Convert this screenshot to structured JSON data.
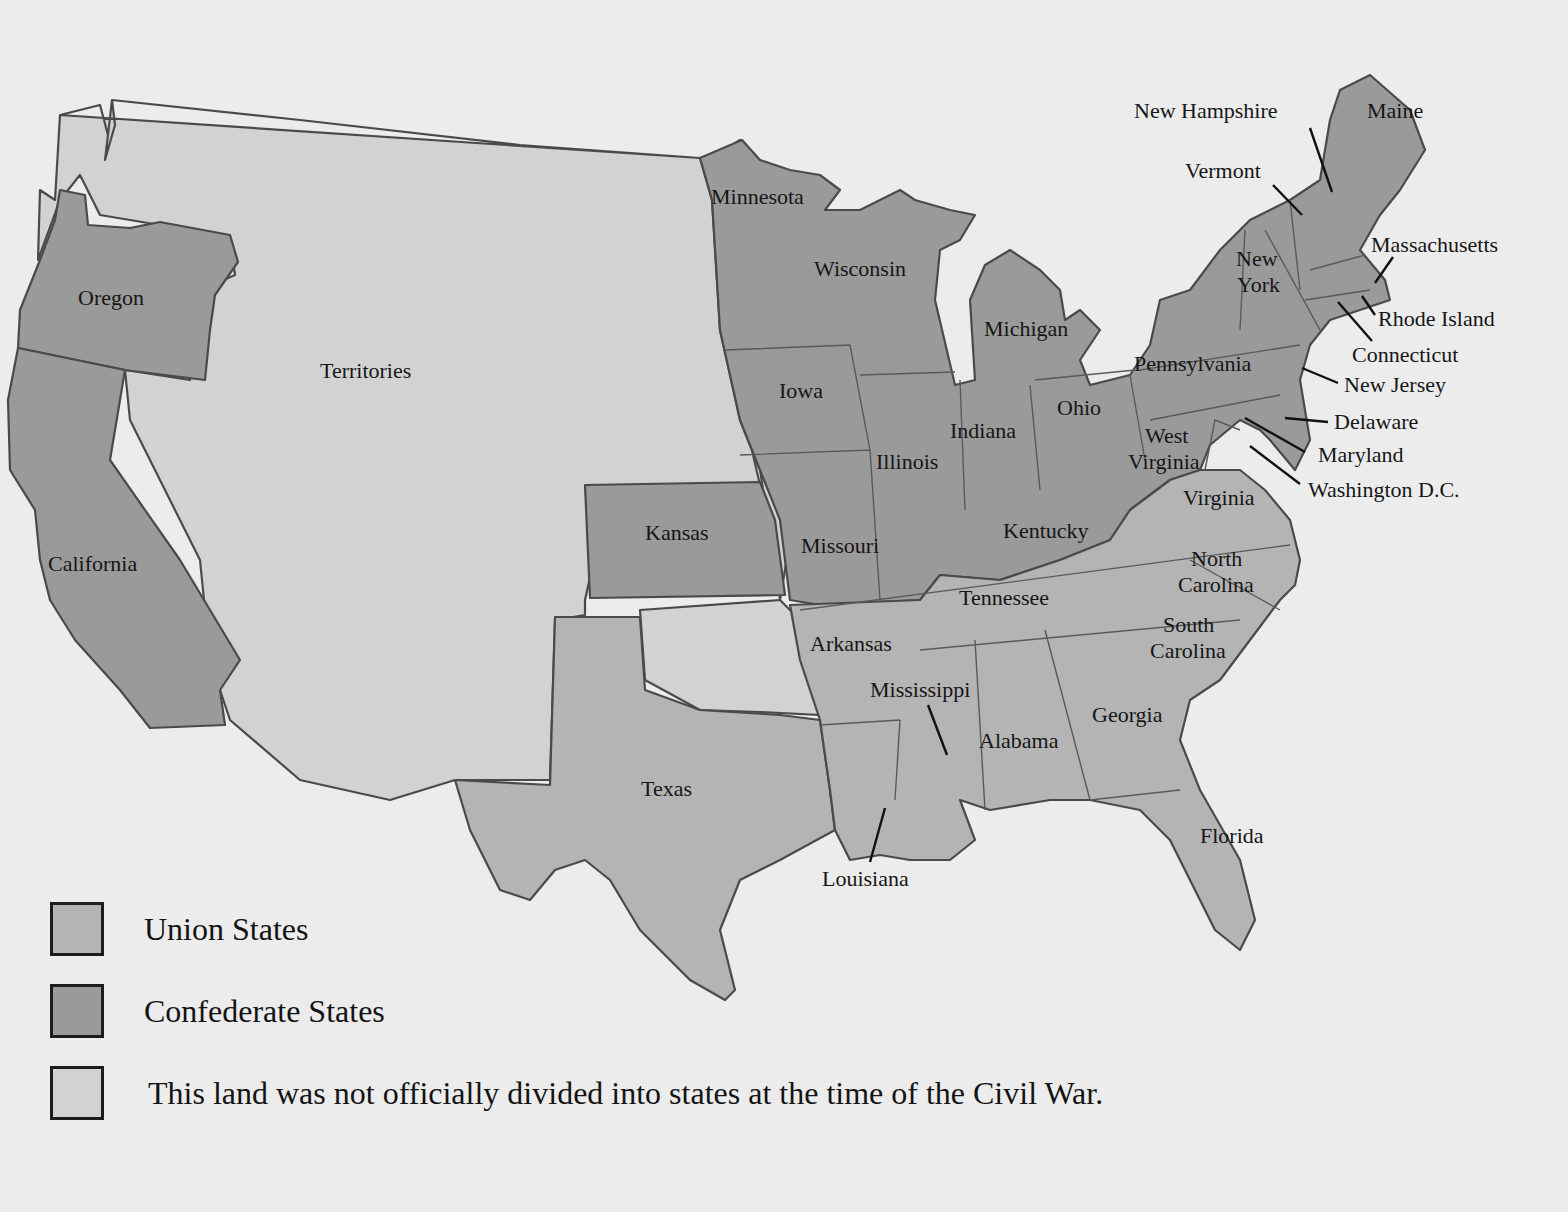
{
  "map": {
    "subject": "United States at the time of the Civil War",
    "colors": {
      "background": "#ececec",
      "dark_tone": "#9a9a9a",
      "medium_tone": "#b4b4b4",
      "light_tone": "#d2d2d2",
      "outline": "#4a4a4a"
    },
    "regions": {
      "territories": "Territories",
      "oregon": "Oregon",
      "california": "California",
      "kansas": "Kansas",
      "minnesota": "Minnesota",
      "wisconsin": "Wisconsin",
      "michigan": "Michigan",
      "iowa": "Iowa",
      "illinois": "Illinois",
      "indiana": "Indiana",
      "ohio": "Ohio",
      "missouri": "Missouri",
      "kentucky": "Kentucky",
      "west_virginia_1": "West",
      "west_virginia_2": "Virginia",
      "virginia": "Virginia",
      "pennsylvania": "Pennsylvania",
      "new_york_1": "New",
      "new_york_2": "York",
      "vermont": "Vermont",
      "new_hampshire": "New Hampshire",
      "maine": "Maine",
      "massachusetts": "Massachusetts",
      "rhode_island": "Rhode Island",
      "connecticut": "Connecticut",
      "new_jersey": "New Jersey",
      "delaware": "Delaware",
      "maryland": "Maryland",
      "washington_dc": "Washington D.C.",
      "north_carolina_1": "North",
      "north_carolina_2": "Carolina",
      "south_carolina_1": "South",
      "south_carolina_2": "Carolina",
      "tennessee": "Tennessee",
      "arkansas": "Arkansas",
      "mississippi": "Mississippi",
      "alabama": "Alabama",
      "georgia": "Georgia",
      "florida": "Florida",
      "louisiana": "Louisiana",
      "texas": "Texas"
    },
    "shading_by_tone": {
      "dark": [
        "Oregon",
        "California",
        "Kansas",
        "Minnesota",
        "Wisconsin",
        "Michigan",
        "Iowa",
        "Illinois",
        "Indiana",
        "Ohio",
        "Missouri",
        "Kentucky",
        "West Virginia",
        "Pennsylvania",
        "New York",
        "Vermont",
        "New Hampshire",
        "Maine",
        "Massachusetts",
        "Rhode Island",
        "Connecticut",
        "New Jersey",
        "Delaware",
        "Maryland"
      ],
      "medium": [
        "Virginia",
        "North Carolina",
        "South Carolina",
        "Tennessee",
        "Arkansas",
        "Mississippi",
        "Alabama",
        "Georgia",
        "Florida",
        "Louisiana",
        "Texas"
      ],
      "light": [
        "Territories"
      ]
    }
  },
  "legend": {
    "items": [
      {
        "label": "Union States",
        "swatch": "#b4b4b4"
      },
      {
        "label": "Confederate States",
        "swatch": "#9a9a9a"
      },
      {
        "label": "This land was not officially divided into states at the time of the Civil War.",
        "swatch": "#d2d2d2"
      }
    ],
    "legend_shading_note": "As printed in the source, the legend swatches appear swapped relative to the map: the map shades Union states (e.g. Kansas, Illinois, Kentucky) with the darker tone and Confederate states (e.g. Texas, Georgia) with the medium tone, while the legend pairs 'Union States' with medium and 'Confederate States' with dark. Reproduced as shown."
  }
}
